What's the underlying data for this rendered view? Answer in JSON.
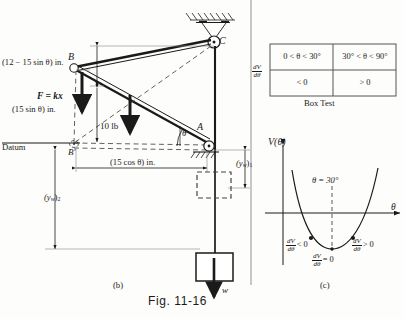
{
  "figure": {
    "number": "Fig. 11-16",
    "panel_b_caption": "(b)",
    "panel_c_caption": "(c)"
  },
  "free_body_diagram": {
    "points": {
      "C": "C",
      "B": "B",
      "B_prime": "B'",
      "A": "A"
    },
    "datum_label": "Datum",
    "spring_force_label": "F = kx",
    "applied_load_label": "10 lb",
    "weight_label": "w",
    "angle_label": "θ",
    "dimensions": [
      {
        "name": "vertical-upper",
        "text": "(12 − 15 sin θ) in."
      },
      {
        "name": "vertical-lower",
        "text": "(15 sin θ) in."
      },
      {
        "name": "horizontal",
        "text": "(15 cos θ) in."
      },
      {
        "name": "weight-height-1",
        "text": "(y",
        "sub": "w",
        "suffix": ")",
        "index": "1"
      },
      {
        "name": "weight-height-2",
        "text": "(y",
        "sub": "w",
        "suffix": ")",
        "index": "2"
      }
    ]
  },
  "box_test": {
    "title": "Box Test",
    "row_label_num": "dV",
    "row_label_den": "dθ",
    "columns": [
      "0 < θ < 30°",
      "30° < θ < 90°"
    ],
    "values": [
      "< 0",
      "> 0"
    ]
  },
  "potential_plot": {
    "y_axis_label": "V(θ)",
    "x_axis_label": "θ",
    "equilibrium_label": "θ = 30°",
    "annotations": [
      {
        "name": "left-branch",
        "num": "dV",
        "den": "dθ",
        "rel": "< 0"
      },
      {
        "name": "minimum",
        "num": "dV",
        "den": "dθ",
        "rel": "= 0"
      },
      {
        "name": "right-branch",
        "num": "dV",
        "den": "dθ",
        "rel": "> 0"
      }
    ]
  },
  "colors": {
    "ink": "#1a1a1a",
    "paper": "#fdfdfb",
    "thin": "#555555"
  }
}
